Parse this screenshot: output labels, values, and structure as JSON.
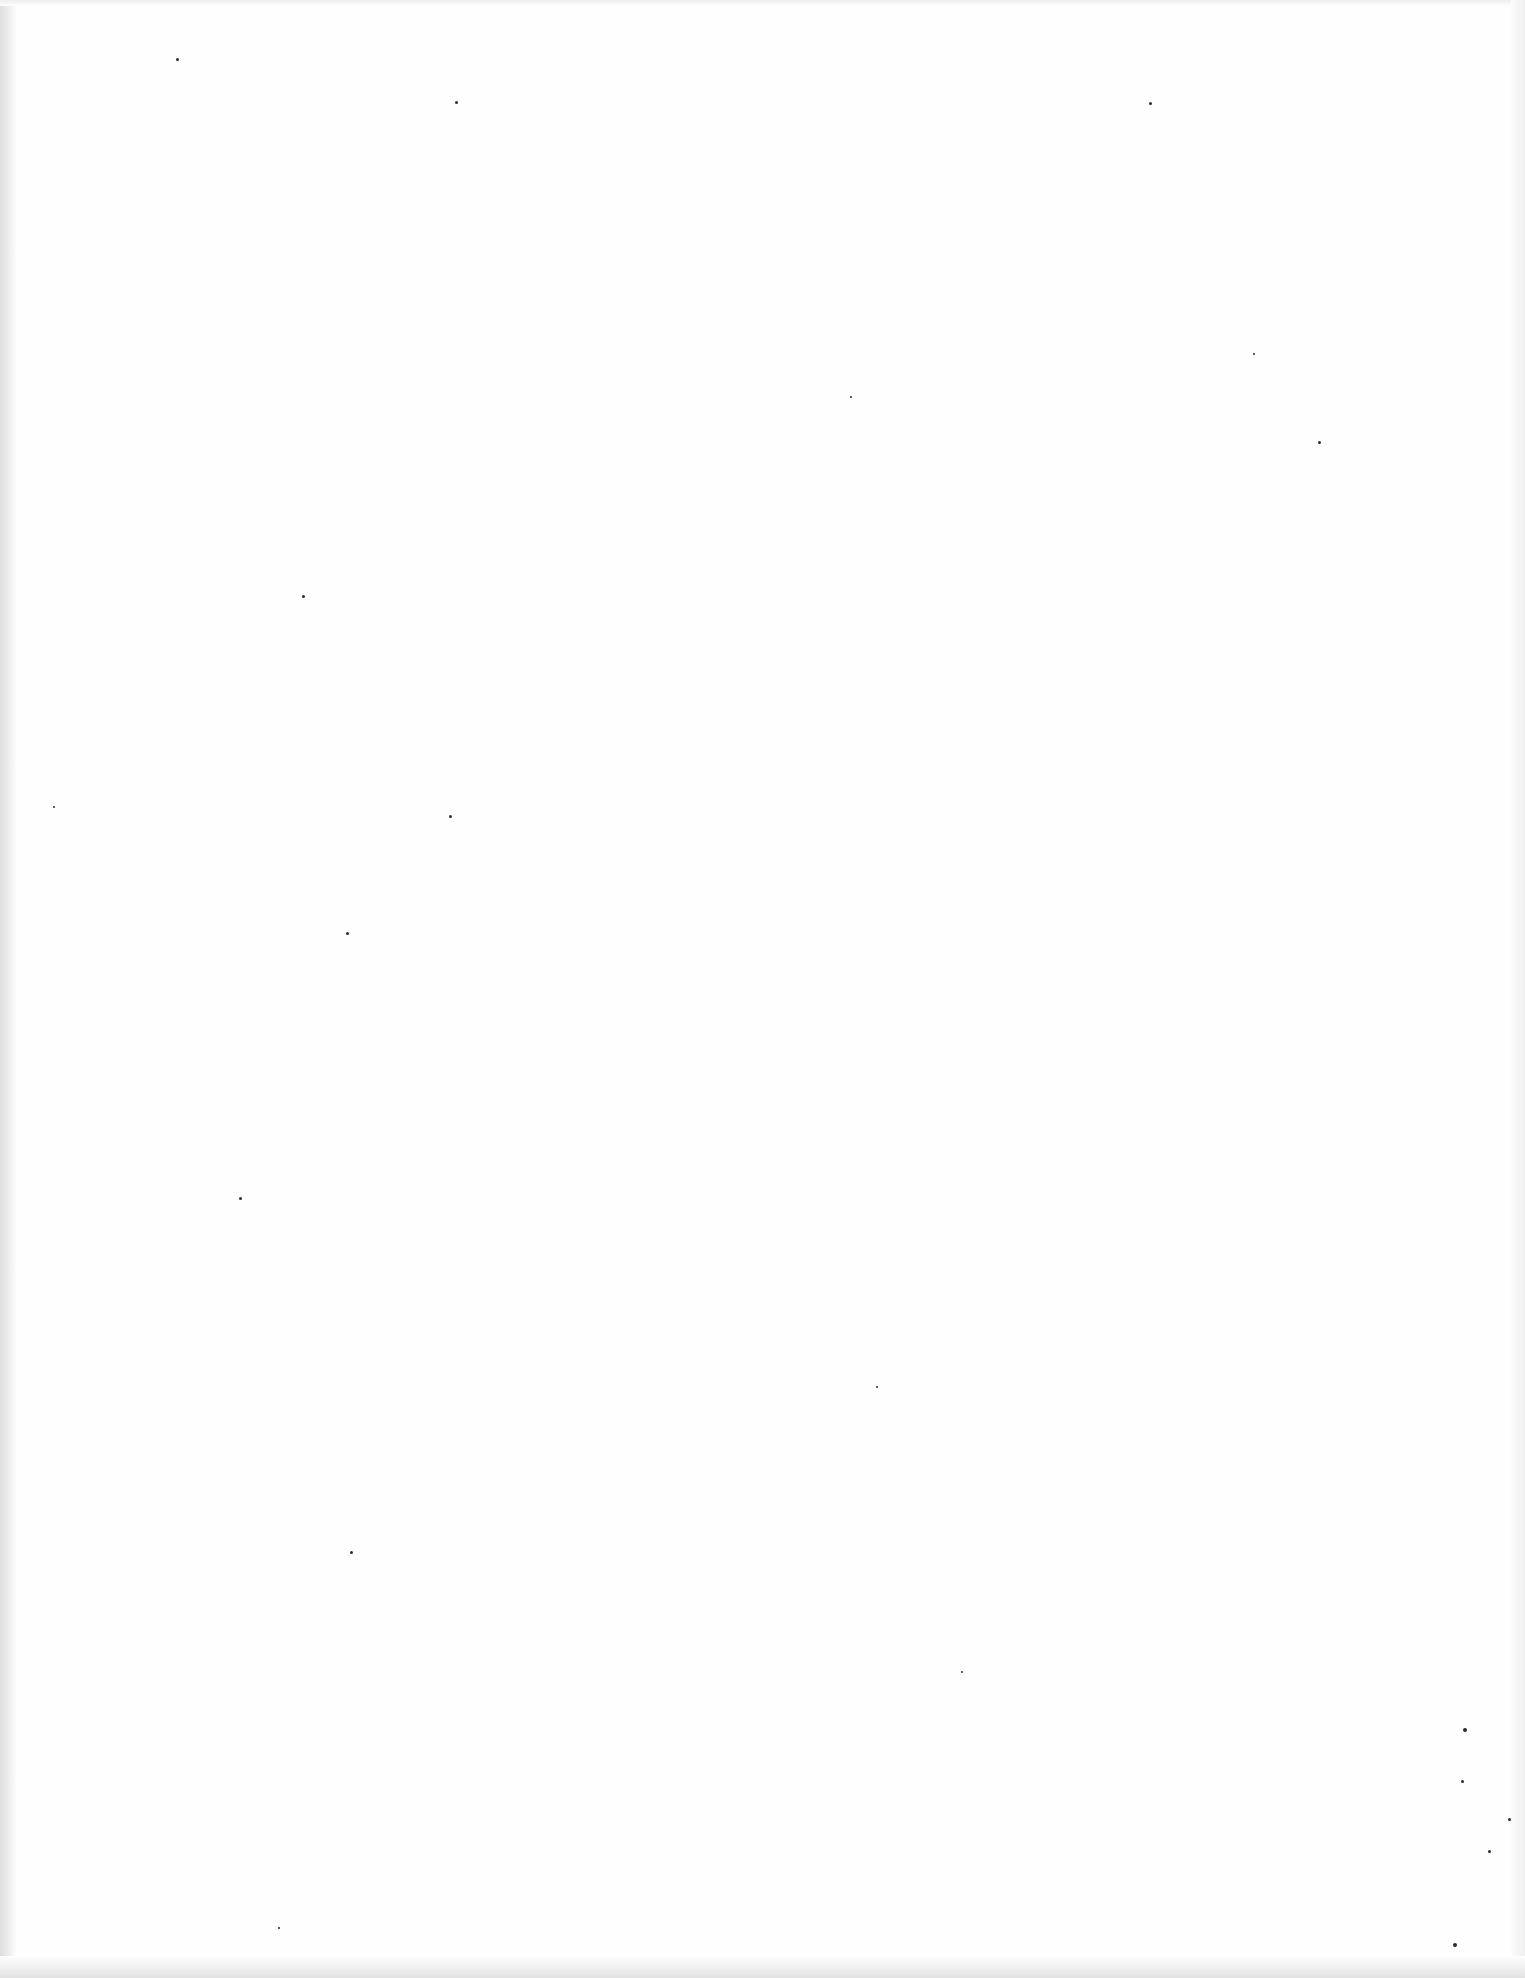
{
  "page": {
    "type": "blank-scanned-page",
    "background_color": "#fefefe",
    "edge_shadow_color": "#dedede",
    "text_content": ""
  },
  "specks": [
    {
      "x": 176,
      "y": 58,
      "size": 3
    },
    {
      "x": 455,
      "y": 101,
      "size": 3
    },
    {
      "x": 1149,
      "y": 102,
      "size": 3
    },
    {
      "x": 1253,
      "y": 353,
      "size": 2
    },
    {
      "x": 1318,
      "y": 441,
      "size": 3
    },
    {
      "x": 302,
      "y": 595,
      "size": 3
    },
    {
      "x": 449,
      "y": 815,
      "size": 3
    },
    {
      "x": 346,
      "y": 932,
      "size": 3
    },
    {
      "x": 239,
      "y": 1197,
      "size": 3
    },
    {
      "x": 350,
      "y": 1551,
      "size": 3
    },
    {
      "x": 961,
      "y": 1671,
      "size": 2
    },
    {
      "x": 1463,
      "y": 1728,
      "size": 4
    },
    {
      "x": 1461,
      "y": 1780,
      "size": 3
    },
    {
      "x": 1508,
      "y": 1818,
      "size": 3
    },
    {
      "x": 1488,
      "y": 1850,
      "size": 3
    },
    {
      "x": 1453,
      "y": 1943,
      "size": 4
    },
    {
      "x": 278,
      "y": 1927,
      "size": 2
    },
    {
      "x": 53,
      "y": 806,
      "size": 2
    },
    {
      "x": 876,
      "y": 1386,
      "size": 2
    },
    {
      "x": 850,
      "y": 396,
      "size": 2
    }
  ]
}
